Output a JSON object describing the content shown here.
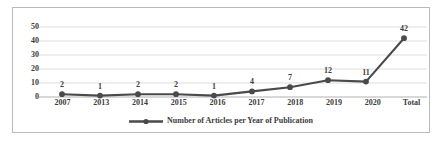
{
  "chart_data": {
    "type": "line",
    "title": "",
    "xlabel": "",
    "ylabel": "",
    "categories": [
      "2007",
      "2013",
      "2014",
      "2015",
      "2016",
      "2017",
      "2018",
      "2019",
      "2020",
      "Total"
    ],
    "values": [
      2,
      1,
      2,
      2,
      1,
      4,
      7,
      12,
      11,
      42
    ],
    "data_labels": [
      "2",
      "1",
      "2",
      "2",
      "1",
      "4",
      "7",
      "12",
      "11",
      "42"
    ],
    "series": [
      {
        "name": "Number of Articles per Year of Publication",
        "values": [
          2,
          1,
          2,
          2,
          1,
          4,
          7,
          12,
          11,
          42
        ],
        "color": "#4a4a4a",
        "marker": "circle"
      }
    ],
    "ylim": [
      0,
      50
    ],
    "yticks": [
      0,
      10,
      20,
      30,
      40,
      50
    ],
    "ytick_labels": [
      "0",
      "10",
      "20",
      "30",
      "40",
      "50"
    ],
    "grid": {
      "horizontal": true,
      "vertical": false,
      "color": "#d4d4d4"
    },
    "legend": {
      "position": "bottom",
      "entries": [
        "Number of Articles per Year of Publication"
      ],
      "marker_icon": "line-with-circle-marker"
    },
    "frame": {
      "border_color": "#b9b9b9",
      "background": "#ffffff"
    },
    "axis_color": "#a8a8a8",
    "label_color": "#3d3d3d"
  }
}
